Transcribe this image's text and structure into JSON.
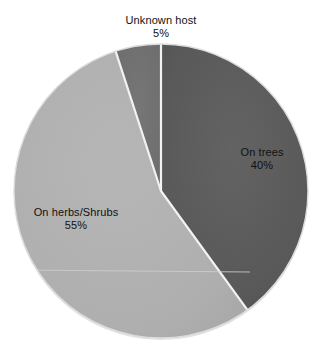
{
  "background_color": "#ffffff",
  "chart_data": {
    "type": "pie",
    "title": "",
    "subtitle": "",
    "xlabel": "",
    "ylabel": "",
    "legend_position": "none",
    "labels_position": "inside-and-outside",
    "grid": false,
    "start_angle_deg": 0,
    "direction": "clockwise",
    "categories": [
      "On trees",
      "On herbs/Shrubs",
      "Unknown host"
    ],
    "values": [
      40,
      55,
      5
    ],
    "value_unit": "%",
    "colors": [
      "#5a5a5a",
      "#b0b0b0",
      "#707070"
    ],
    "slices": [
      {
        "name": "On trees",
        "value": 40,
        "value_label": "40%",
        "color": "#5a5a5a",
        "start_deg": 0,
        "end_deg": 144,
        "label_placement": "inside"
      },
      {
        "name": "On herbs/Shrubs",
        "value": 55,
        "value_label": "55%",
        "color": "#b0b0b0",
        "start_deg": 144,
        "end_deg": 342,
        "label_placement": "inside"
      },
      {
        "name": "Unknown host",
        "value": 5,
        "value_label": "5%",
        "color": "#707070",
        "start_deg": 342,
        "end_deg": 360,
        "label_placement": "outside-top"
      }
    ]
  },
  "geometry": {
    "center_x": 161,
    "center_y": 191,
    "radius": 147,
    "separator_color": "#f2f2f2",
    "separator_width": 2.2,
    "outline_color": "#d8d8d8"
  },
  "labels": {
    "unknown_host": {
      "name": "Unknown host",
      "pct": "5%"
    },
    "on_trees": {
      "name": "On trees",
      "pct": "40%"
    },
    "on_herbs": {
      "name": "On herbs/Shrubs",
      "pct": "55%"
    }
  }
}
